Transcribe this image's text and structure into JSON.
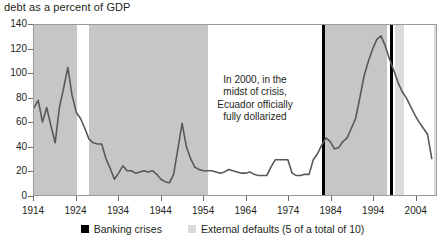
{
  "chart_data": {
    "type": "line",
    "title": "debt as a percent of GDP",
    "xlabel": "",
    "ylabel": "",
    "xlim": [
      1914,
      2009
    ],
    "ylim": [
      0,
      140
    ],
    "ytick_labels": [
      "140",
      "120",
      "100",
      "80",
      "60",
      "40",
      "20",
      "0"
    ],
    "ytick_values": [
      140,
      120,
      100,
      80,
      60,
      40,
      20,
      0
    ],
    "xtick_labels": [
      "1914",
      "1924",
      "1934",
      "1944",
      "1954",
      "1964",
      "1974",
      "1984",
      "1994",
      "2004"
    ],
    "xtick_values": [
      1914,
      1924,
      1934,
      1944,
      1954,
      1964,
      1974,
      1984,
      1994,
      2004
    ],
    "grid": false,
    "legend_position": "bottom",
    "series": [
      {
        "name": "debt as a percent of GDP",
        "color": "#58585a",
        "x": [
          1914,
          1915,
          1916,
          1917,
          1918,
          1919,
          1920,
          1921,
          1922,
          1923,
          1924,
          1925,
          1926,
          1927,
          1928,
          1929,
          1930,
          1931,
          1932,
          1933,
          1934,
          1935,
          1936,
          1937,
          1938,
          1939,
          1940,
          1941,
          1942,
          1943,
          1944,
          1945,
          1946,
          1947,
          1948,
          1949,
          1950,
          1951,
          1952,
          1953,
          1954,
          1955,
          1956,
          1957,
          1958,
          1959,
          1960,
          1961,
          1962,
          1963,
          1964,
          1965,
          1966,
          1967,
          1968,
          1969,
          1970,
          1971,
          1972,
          1973,
          1974,
          1975,
          1976,
          1977,
          1978,
          1979,
          1980,
          1981,
          1982,
          1983,
          1984,
          1985,
          1986,
          1987,
          1988,
          1989,
          1990,
          1991,
          1992,
          1993,
          1994,
          1995,
          1996,
          1997,
          1998,
          1999,
          2000,
          2001,
          2002,
          2003,
          2004,
          2005,
          2006,
          2007,
          2008
        ],
        "y": [
          72,
          78,
          60,
          72,
          57,
          43,
          72,
          88,
          105,
          82,
          68,
          63,
          55,
          46,
          43,
          42,
          42,
          30,
          22,
          13,
          18,
          24,
          20,
          20,
          18,
          19,
          20,
          19,
          20,
          17,
          13,
          11,
          10,
          17,
          38,
          59,
          40,
          30,
          23,
          21,
          20,
          20,
          20,
          19,
          18,
          19,
          21,
          20,
          19,
          18,
          18,
          19,
          17,
          16,
          16,
          16,
          23,
          29,
          29,
          29,
          29,
          18,
          16,
          16,
          17,
          17,
          29,
          34,
          41,
          47,
          44,
          38,
          39,
          44,
          47,
          55,
          63,
          80,
          98,
          110,
          120,
          128,
          131,
          123,
          112,
          103,
          93,
          85,
          80,
          73,
          66,
          60,
          55,
          50,
          30
        ]
      }
    ],
    "annotations": [
      {
        "name": "dollarization-note",
        "text": "In 2000, in the midst of crisis, Ecuador officially fully dollarized",
        "lines": [
          "In 2000, in the",
          "midst of crisis,",
          "Ecuador officially",
          "fully dollarized"
        ]
      }
    ],
    "banking_crises": [
      {
        "year": 1982,
        "label": "Banking crisis 1982"
      },
      {
        "year": 1998,
        "label": "Banking crisis 1998"
      }
    ],
    "external_default_periods": [
      {
        "start": 1914,
        "end": 1924
      },
      {
        "start": 1927,
        "end": 1955
      },
      {
        "start": 1982,
        "end": 1997
      },
      {
        "start": 1999,
        "end": 2001
      },
      {
        "start": 2008,
        "end": 2009
      }
    ],
    "legend": [
      {
        "swatch": "crisis",
        "color": "#000000",
        "label": "Banking crises"
      },
      {
        "swatch": "default",
        "color": "#d9d9d9",
        "label": "External defaults (5 of a total of 10)"
      }
    ]
  },
  "colors": {
    "line": "#58585a",
    "band_default": "#c6c6c6",
    "band_default_light": "#dcdcdc",
    "band_crisis": "#000000",
    "axis": "#6d6d6d",
    "text": "#231f20",
    "plot_border": "#9a9a9a"
  }
}
